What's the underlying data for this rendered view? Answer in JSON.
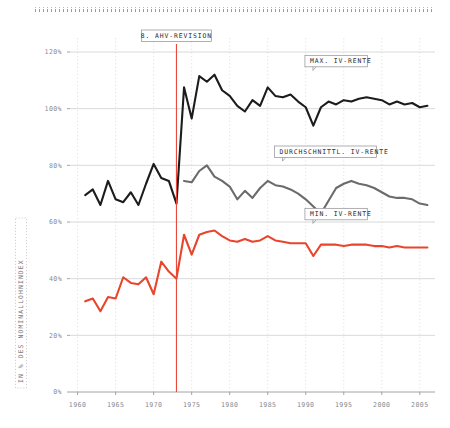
{
  "chart_data": {
    "type": "line",
    "title": "",
    "xlabel": "",
    "ylabel": "IN % DES NOMINALLOHNINDEX",
    "xlim": [
      1959,
      2007
    ],
    "ylim": [
      0,
      120
    ],
    "ytick_values": [
      0,
      20,
      40,
      60,
      80,
      100,
      120
    ],
    "ytick_labels": [
      "0%",
      "20%",
      "40%",
      "60%",
      "80%",
      "100%",
      "120%"
    ],
    "xtick_values": [
      1960,
      1965,
      1970,
      1975,
      1980,
      1985,
      1990,
      1995,
      2000,
      2005
    ],
    "xtick_labels": [
      "1960",
      "1965",
      "1970",
      "1975",
      "1980",
      "1985",
      "1990",
      "1995",
      "2000",
      "2005"
    ],
    "grid": "horizontal solid light grey, vertical dotted light grey",
    "legend_position": "inline annotations on plot",
    "annotations": [
      {
        "label": "8. AHV-REVISION",
        "x": 1973,
        "kind": "vertical-marker",
        "color": "#e8493a"
      },
      {
        "label": "MAX. IV-RENTE",
        "x": 1992,
        "y": 113,
        "kind": "series-callout",
        "target_series": "MAX. IV-RENTE"
      },
      {
        "label": "DURCHSCHNITTL. IV-RENTE",
        "x": 1988,
        "y": 81,
        "kind": "series-callout",
        "target_series": "DURCHSCHNITTL. IV-RENTE"
      },
      {
        "label": "MIN. IV-RENTE",
        "x": 1992,
        "y": 59,
        "kind": "series-callout",
        "target_series": "MIN. IV-RENTE"
      }
    ],
    "series": [
      {
        "name": "MAX. IV-RENTE",
        "color": "#1c1c1c",
        "width": 2.1,
        "x": [
          1961,
          1962,
          1963,
          1964,
          1965,
          1966,
          1967,
          1968,
          1969,
          1970,
          1971,
          1972,
          1973,
          1974,
          1975,
          1976,
          1977,
          1978,
          1979,
          1980,
          1981,
          1982,
          1983,
          1984,
          1985,
          1986,
          1987,
          1988,
          1989,
          1990,
          1991,
          1992,
          1993,
          1994,
          1995,
          1996,
          1997,
          1998,
          1999,
          2000,
          2001,
          2002,
          2003,
          2004,
          2005,
          2006
        ],
        "values": [
          69.5,
          71.5,
          66.0,
          74.5,
          68.0,
          67.0,
          70.5,
          66.0,
          73.5,
          80.5,
          75.5,
          74.5,
          66.5,
          107.5,
          96.5,
          111.5,
          109.5,
          112.0,
          106.5,
          104.5,
          101.0,
          99.0,
          103.0,
          101.0,
          107.5,
          104.5,
          104.0,
          105.0,
          102.5,
          100.5,
          94.0,
          100.5,
          102.5,
          101.5,
          103.0,
          102.5,
          103.5,
          104.0,
          103.5,
          103.0,
          101.5,
          102.5,
          101.5,
          102.0,
          100.5,
          101.0
        ]
      },
      {
        "name": "DURCHSCHNITTL. IV-RENTE",
        "color": "#6b6b6b",
        "width": 2.1,
        "x": [
          1974,
          1975,
          1976,
          1977,
          1978,
          1979,
          1980,
          1981,
          1982,
          1983,
          1984,
          1985,
          1986,
          1987,
          1988,
          1989,
          1990,
          1991,
          1992,
          1993,
          1994,
          1995,
          1996,
          1997,
          1998,
          1999,
          2000,
          2001,
          2002,
          2003,
          2004,
          2005,
          2006
        ],
        "values": [
          74.5,
          74.0,
          78.0,
          80.0,
          76.0,
          74.5,
          72.5,
          68.0,
          71.0,
          68.5,
          72.0,
          74.5,
          73.0,
          72.5,
          71.5,
          70.0,
          68.0,
          65.5,
          63.0,
          67.5,
          72.0,
          73.5,
          74.5,
          73.5,
          73.0,
          72.0,
          70.5,
          69.0,
          68.5,
          68.5,
          68.0,
          66.5,
          66.0
        ]
      },
      {
        "name": "MIN. IV-RENTE",
        "color": "#e8452c",
        "width": 2.1,
        "x": [
          1961,
          1962,
          1963,
          1964,
          1965,
          1966,
          1967,
          1968,
          1969,
          1970,
          1971,
          1972,
          1973,
          1974,
          1975,
          1976,
          1977,
          1978,
          1979,
          1980,
          1981,
          1982,
          1983,
          1984,
          1985,
          1986,
          1987,
          1988,
          1989,
          1990,
          1991,
          1992,
          1993,
          1994,
          1995,
          1996,
          1997,
          1998,
          1999,
          2000,
          2001,
          2002,
          2003,
          2004,
          2005,
          2006
        ],
        "values": [
          32.0,
          33.0,
          28.5,
          33.5,
          33.0,
          40.5,
          38.5,
          38.0,
          40.5,
          34.5,
          46.0,
          42.5,
          40.0,
          55.5,
          48.5,
          55.5,
          56.5,
          57.0,
          55.0,
          53.5,
          53.0,
          54.0,
          53.0,
          53.5,
          55.0,
          53.5,
          53.0,
          52.5,
          52.5,
          52.5,
          48.0,
          52.0,
          52.0,
          52.0,
          51.5,
          52.0,
          52.0,
          52.0,
          51.5,
          51.5,
          51.0,
          51.5,
          51.0,
          51.0,
          51.0,
          51.0
        ]
      }
    ]
  },
  "colors": {
    "max_line": "#1c1c1c",
    "avg_line": "#6b6b6b",
    "min_line": "#e8452c",
    "marker_line": "#e8493a",
    "grid_h": "#cfcfd2",
    "grid_v": "#d9d9dc",
    "tick_label": "#8a8a90"
  }
}
